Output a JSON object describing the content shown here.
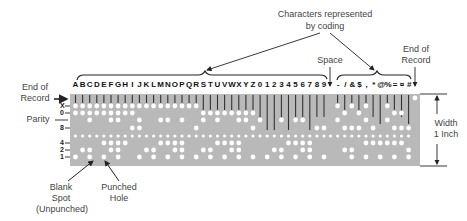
{
  "labels": {
    "characters_line1": "Characters represented",
    "characters_line2": "by coding",
    "space": "Space",
    "end_record_right_1": "End of",
    "end_record_right_2": "Record",
    "end_record_left_1": "End of",
    "end_record_left_2": "Record",
    "parity": "Parity",
    "width_1": "Width",
    "width_2": "1 Inch",
    "blank_1": "Blank",
    "blank_2": "Spot",
    "blank_3": "(Unpunched)",
    "punched_1": "Punched",
    "punched_2": "Hole"
  },
  "row_labels": [
    "X",
    "0",
    "8",
    "4",
    "2",
    "1"
  ],
  "characters": [
    "A",
    "B",
    "C",
    "D",
    "E",
    "F",
    "G",
    "H",
    "I",
    "J",
    "K",
    "L",
    "M",
    "N",
    "O",
    "P",
    "Q",
    "R",
    "S",
    "T",
    "U",
    "V",
    "W",
    "X",
    "Y",
    "Z",
    "0",
    "1",
    "2",
    "3",
    "4",
    "5",
    "6",
    "7",
    "8",
    "9",
    " ",
    "-",
    "/",
    "&",
    "$",
    ",",
    "*",
    "@",
    "%",
    "=",
    "¤",
    "#"
  ],
  "colors": {
    "card": "#b9b9b9",
    "hole": "#ffffff",
    "line": "#222222"
  }
}
